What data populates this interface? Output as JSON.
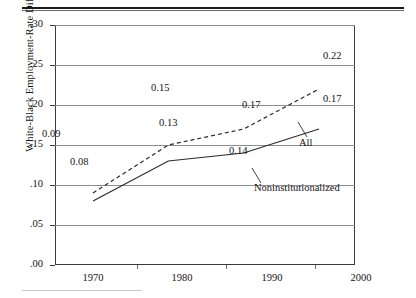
{
  "chart_data": {
    "type": "line",
    "title": "",
    "xlabel": "",
    "ylabel": "White-Black Employment-Rate Difference",
    "x": [
      1970,
      1980,
      1990,
      2000
    ],
    "xtick_labels": [
      "1970",
      "1980",
      "1990",
      "2000"
    ],
    "ylim": [
      0.0,
      0.3
    ],
    "ytick_values": [
      0.0,
      0.05,
      0.1,
      0.15,
      0.2,
      0.25,
      0.3
    ],
    "ytick_labels": [
      ".00",
      ".05",
      ".10",
      ".15",
      ".20",
      ".25",
      ".30"
    ],
    "grid": true,
    "legend_position": "inline-annotations",
    "series": [
      {
        "name": "All",
        "style": "dashed",
        "color": "#2b2b2b",
        "values": [
          0.09,
          0.15,
          0.17,
          0.22
        ],
        "point_labels": [
          "0.09",
          "0.15",
          "0.17",
          "0.22"
        ]
      },
      {
        "name": "Noninstitutionalized",
        "style": "solid",
        "color": "#2b2b2b",
        "values": [
          0.08,
          0.13,
          0.14,
          0.17
        ],
        "point_labels": [
          "0.08",
          "0.13",
          "0.14",
          "0.17"
        ]
      }
    ],
    "annotations": [
      {
        "text": "All",
        "series": "All"
      },
      {
        "text": "Noninstitutionalized",
        "series": "Noninstitutionalized"
      }
    ]
  }
}
